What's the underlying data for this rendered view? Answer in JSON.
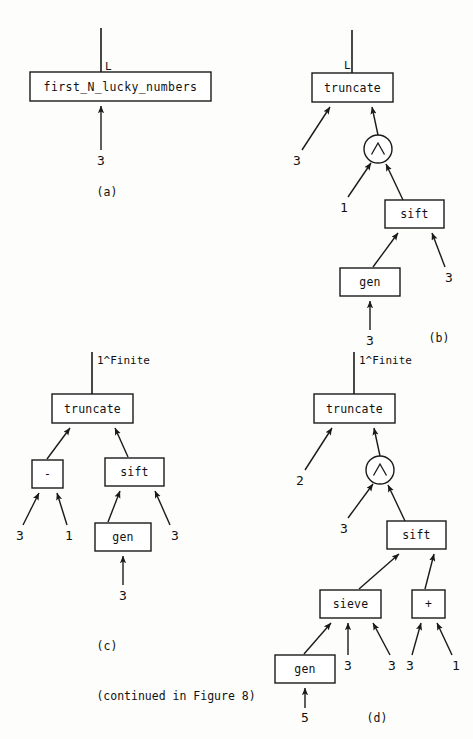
{
  "figure": {
    "caption": "(continued in Figure 8)",
    "panels": [
      {
        "id": "a",
        "label": "(a)",
        "output_port": "L",
        "boxes": [
          {
            "name": "first_N_lucky_numbers",
            "label": "first_N_lucky_numbers"
          }
        ],
        "inputs": [
          "3"
        ]
      },
      {
        "id": "b",
        "label": "(b)",
        "output_port": "L",
        "boxes": [
          {
            "name": "truncate",
            "label": "truncate"
          },
          {
            "name": "sift",
            "label": "sift"
          },
          {
            "name": "gen",
            "label": "gen"
          }
        ],
        "operator": "/\\",
        "inputs": [
          "3",
          "1",
          "3",
          "3"
        ]
      },
      {
        "id": "c",
        "label": "(c)",
        "output_port": "1^Finite",
        "boxes": [
          {
            "name": "truncate",
            "label": "truncate"
          },
          {
            "name": "minus",
            "label": "-"
          },
          {
            "name": "sift",
            "label": "sift"
          },
          {
            "name": "gen",
            "label": "gen"
          }
        ],
        "inputs": [
          "3",
          "1",
          "3",
          "3"
        ]
      },
      {
        "id": "d",
        "label": "(d)",
        "output_port": "1^Finite",
        "boxes": [
          {
            "name": "truncate",
            "label": "truncate"
          },
          {
            "name": "sift",
            "label": "sift"
          },
          {
            "name": "sieve",
            "label": "sieve"
          },
          {
            "name": "plus",
            "label": "+"
          },
          {
            "name": "gen",
            "label": "gen"
          }
        ],
        "operator": "/\\",
        "inputs": [
          "2",
          "3",
          "3",
          "3",
          "3",
          "1",
          "5"
        ]
      }
    ]
  },
  "labels": {
    "panel_a": "(a)",
    "panel_b": "(b)",
    "panel_c": "(c)",
    "panel_d": "(d)",
    "port_L_a": "L",
    "port_L_b": "L",
    "port_finite_c": "1^Finite",
    "port_finite_d": "1^Finite",
    "box_a_first": "first_N_lucky_numbers",
    "box_b_truncate": "truncate",
    "box_b_sift": "sift",
    "box_b_gen": "gen",
    "box_c_truncate": "truncate",
    "box_c_minus": "-",
    "box_c_sift": "sift",
    "box_c_gen": "gen",
    "box_d_truncate": "truncate",
    "box_d_sift": "sift",
    "box_d_sieve": "sieve",
    "box_d_plus": "+",
    "box_d_gen": "gen",
    "op_b": "/\\",
    "op_d": "/\\",
    "n_a_1": "3",
    "n_b_1": "3",
    "n_b_2": "1",
    "n_b_3": "3",
    "n_b_4": "3",
    "n_c_1": "3",
    "n_c_2": "1",
    "n_c_3": "3",
    "n_c_4": "3",
    "n_d_1": "2",
    "n_d_2": "3",
    "n_d_3": "3",
    "n_d_4": "3",
    "n_d_5": "3",
    "n_d_6": "1",
    "n_d_7": "5",
    "caption": "(continued in Figure 8)"
  }
}
